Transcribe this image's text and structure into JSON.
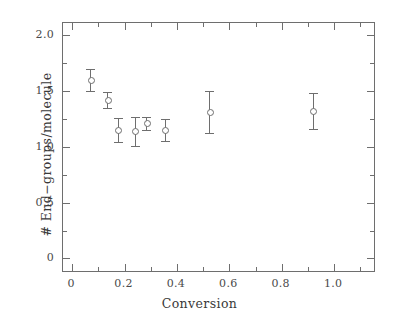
{
  "chart_data": {
    "type": "scatter",
    "title": "",
    "xlabel": "Conversion",
    "ylabel": "# End−groups/molecule",
    "xlim": [
      -0.035,
      1.16
    ],
    "ylim": [
      -0.13,
      2.11
    ],
    "grid": false,
    "legend": null,
    "x_ticks": [
      "0",
      "0.2",
      "0.4",
      "0.6",
      "0.8",
      "1.0"
    ],
    "x_tick_values": [
      0,
      0.2,
      0.4,
      0.6,
      0.8,
      1.0
    ],
    "x_minor_tick_values": [
      0.1,
      0.3,
      0.5,
      0.7,
      0.9,
      1.1
    ],
    "y_ticks": [
      "0",
      "0.5",
      "1.0",
      "1.5",
      "2.0"
    ],
    "y_tick_values": [
      0,
      0.5,
      1.0,
      1.5,
      2.0
    ],
    "y_minor_tick_values": [
      0.25,
      0.75,
      1.25,
      1.75
    ],
    "marker_style": "open-circle",
    "error_bars": "vertical",
    "axis_color": "#6e6e6e",
    "marker_color": "#6e6e6e",
    "background_color": "#ffffff",
    "x": [
      0.07,
      0.135,
      0.175,
      0.24,
      0.285,
      0.355,
      0.525,
      0.92
    ],
    "y": [
      1.6,
      1.42,
      1.15,
      1.14,
      1.21,
      1.15,
      1.31,
      1.32
    ],
    "yerr": [
      0.1,
      0.075,
      0.11,
      0.13,
      0.06,
      0.1,
      0.19,
      0.16
    ],
    "points": [
      {
        "x": 0.07,
        "y": 1.6,
        "yerr": 0.1
      },
      {
        "x": 0.135,
        "y": 1.42,
        "yerr": 0.075
      },
      {
        "x": 0.175,
        "y": 1.15,
        "yerr": 0.11
      },
      {
        "x": 0.24,
        "y": 1.14,
        "yerr": 0.13
      },
      {
        "x": 0.285,
        "y": 1.21,
        "yerr": 0.06
      },
      {
        "x": 0.355,
        "y": 1.15,
        "yerr": 0.1
      },
      {
        "x": 0.525,
        "y": 1.31,
        "yerr": 0.19
      },
      {
        "x": 0.92,
        "y": 1.32,
        "yerr": 0.16
      }
    ]
  }
}
